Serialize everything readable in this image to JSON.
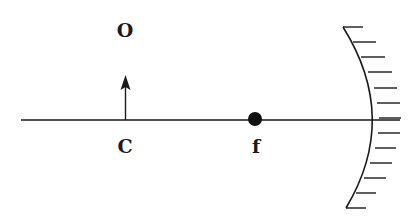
{
  "diagram": {
    "type": "optics-ray-diagram",
    "colors": {
      "ink": "#1a1a1a",
      "background": "#ffffff"
    },
    "labels": {
      "object": "O",
      "center_of_curvature": "C",
      "focal_point": "f"
    },
    "elements": {
      "principal_axis": {
        "x1": 21,
        "x2": 400,
        "y": 120
      },
      "object_arrow": {
        "x": 125,
        "base_y": 120,
        "tip_y": 75
      },
      "focal_point_dot": {
        "cx": 255,
        "cy": 119,
        "r": 7
      },
      "concave_mirror": {
        "top": {
          "x": 343,
          "y": 27
        },
        "vertex": {
          "x": 380,
          "y": 118
        },
        "bottom": {
          "x": 346,
          "y": 208
        },
        "hatch_count": 13
      }
    }
  }
}
